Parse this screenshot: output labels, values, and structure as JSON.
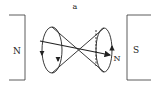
{
  "diagram": {
    "label": "a",
    "left_pole": "N",
    "right_pole": "S",
    "needle_label": "N",
    "stroke_color": "#222222",
    "background": "#ffffff"
  }
}
